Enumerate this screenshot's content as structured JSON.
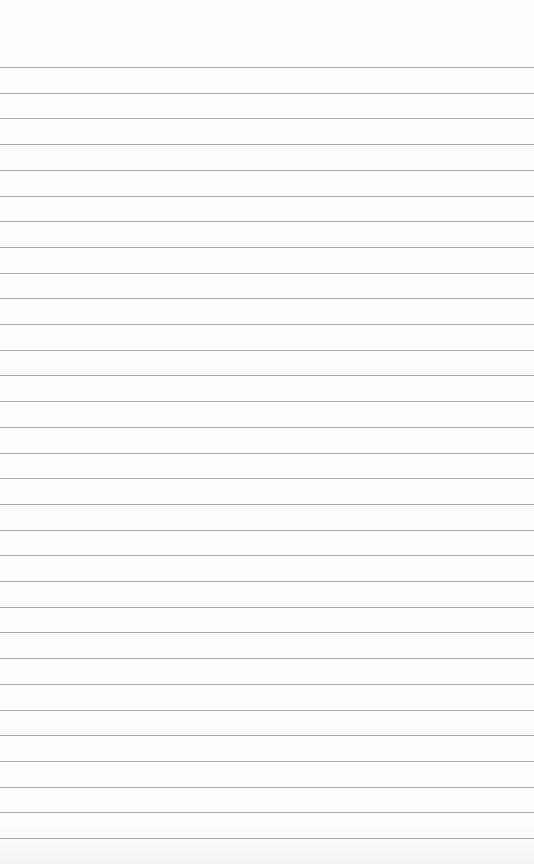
{
  "paper": {
    "type": "lined paper",
    "background": "#fefefe",
    "line_color": "#9a9a9a",
    "first_line_y": 67,
    "line_spacing": 25.7,
    "line_count": 31
  }
}
